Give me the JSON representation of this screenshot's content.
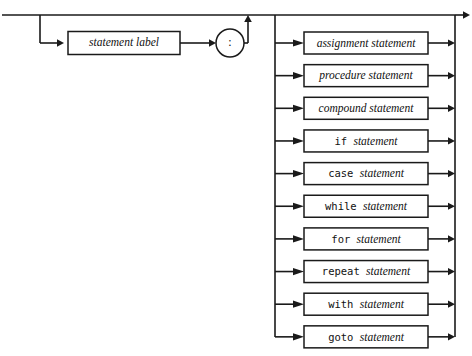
{
  "diagram": {
    "name": "statement",
    "type": "syntax-railroad-diagram",
    "colors": {
      "background": "#ffffff",
      "line": "#1a1a1a",
      "text": "#111111",
      "box_fill": "#ffffff"
    },
    "optional_prefix": {
      "label_box": "statement label",
      "separator": ":"
    },
    "alternatives": [
      {
        "keyword": "",
        "term": "assignment statement",
        "style": "italic"
      },
      {
        "keyword": "",
        "term": "procedure statement",
        "style": "italic"
      },
      {
        "keyword": "",
        "term": "compound statement",
        "style": "italic"
      },
      {
        "keyword": "if",
        "term": "statement",
        "style": "keyword-italic"
      },
      {
        "keyword": "case",
        "term": "statement",
        "style": "keyword-italic"
      },
      {
        "keyword": "while",
        "term": "statement",
        "style": "keyword-italic"
      },
      {
        "keyword": "for",
        "term": "statement",
        "style": "keyword-italic"
      },
      {
        "keyword": "repeat",
        "term": "statement",
        "style": "keyword-italic"
      },
      {
        "keyword": "with",
        "term": "statement",
        "style": "keyword-italic"
      },
      {
        "keyword": "goto",
        "term": "statement",
        "style": "keyword-italic"
      }
    ]
  }
}
